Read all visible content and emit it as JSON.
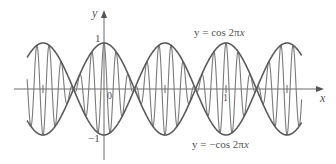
{
  "chart_data": {
    "type": "line",
    "title": "",
    "xlabel": "x",
    "ylabel": "y",
    "xlim": [
      -0.63,
      1.63
    ],
    "ylim": [
      -1.1,
      1.1
    ],
    "grid": false,
    "legend": "inline annotations",
    "x_ticks": [
      {
        "value": -0.5,
        "label": ""
      },
      {
        "value": 0,
        "label": "0"
      },
      {
        "value": 0.5,
        "label": ""
      },
      {
        "value": 1,
        "label": "1"
      },
      {
        "value": 1.5,
        "label": ""
      }
    ],
    "y_ticks": [
      {
        "value": 1,
        "label": "1"
      },
      {
        "value": -1,
        "label": "−1"
      }
    ],
    "series": [
      {
        "name": "y = cos 2πx",
        "formula": "cos(2*pi*x)",
        "role": "upper envelope",
        "x_range": [
          -0.63,
          1.62
        ]
      },
      {
        "name": "y = −cos 2πx",
        "formula": "-cos(2*pi*x)",
        "role": "lower envelope",
        "x_range": [
          -0.63,
          1.62
        ]
      },
      {
        "name": "y = cos 2πx · cos 20πx",
        "formula": "cos(2*pi*x)*cos(20*pi*x)",
        "role": "modulated oscillation",
        "x_range": [
          -0.63,
          1.62
        ]
      }
    ],
    "annotations": [
      {
        "text": "y = cos 2πx",
        "position": "top-right"
      },
      {
        "text": "y = −cos 2πx",
        "position": "bottom-right"
      }
    ]
  },
  "labels": {
    "x_axis": "x",
    "y_axis": "y",
    "origin": "0",
    "x_one": "1",
    "y_one": "1",
    "y_minus_one": "−1",
    "upper_prefix": "y = cos 2π",
    "upper_var": "x",
    "lower_prefix": "y = −cos 2π",
    "lower_var": "x"
  },
  "style": {
    "axis_color": "#6b6b6b",
    "envelope_color": "#5a5a5a",
    "oscillation_color": "#7a7a7a"
  }
}
